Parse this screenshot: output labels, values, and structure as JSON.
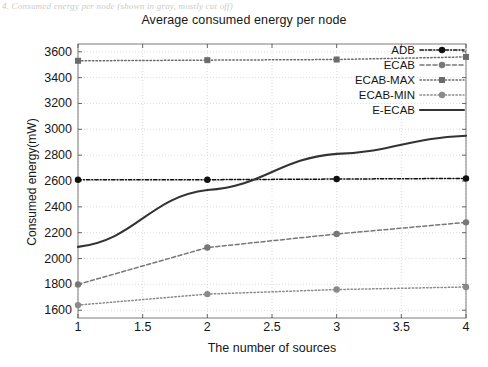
{
  "page": {
    "top_caption": "4. Consumed energy per node (shown in gray, mostly cut off)"
  },
  "chart_data": {
    "type": "line",
    "title": "Average consumed energy per node",
    "xlabel": "The number of sources",
    "ylabel": "Consumed energy(mW)",
    "x": [
      1,
      2,
      3,
      4
    ],
    "xlim": [
      1,
      4
    ],
    "ylim": [
      1540,
      3660
    ],
    "xticks": [
      "1",
      "1.5",
      "2",
      "2.5",
      "3",
      "3.5",
      "4"
    ],
    "xtick_values": [
      1,
      1.5,
      2,
      2.5,
      3,
      3.5,
      4
    ],
    "yticks": [
      "1600",
      "1800",
      "2000",
      "2200",
      "2400",
      "2600",
      "2800",
      "3000",
      "3200",
      "3400",
      "3600"
    ],
    "ytick_values": [
      1600,
      1800,
      2000,
      2200,
      2400,
      2600,
      2800,
      3000,
      3200,
      3400,
      3600
    ],
    "grid": true,
    "legend_position": "top-right",
    "series": [
      {
        "name": "ADB",
        "values": [
          2610,
          2610,
          2615,
          2620
        ],
        "style": "dash-dot",
        "marker": "circle",
        "color": "#111111"
      },
      {
        "name": "ECAB",
        "values": [
          1800,
          2085,
          2190,
          2280
        ],
        "style": "dashed",
        "marker": "circle",
        "color": "#777777"
      },
      {
        "name": "ECAB-MAX",
        "values": [
          3530,
          3535,
          3540,
          3560
        ],
        "style": "dotted",
        "marker": "square",
        "color": "#6b6b6b"
      },
      {
        "name": "ECAB-MIN",
        "values": [
          1640,
          1725,
          1760,
          1780
        ],
        "style": "dotted",
        "marker": "circle",
        "color": "#8a8a8a"
      },
      {
        "name": "E-ECAB",
        "values": [
          2090,
          2530,
          2810,
          2950
        ],
        "style": "solid",
        "marker": "none",
        "color": "#333333"
      }
    ]
  },
  "legend": {
    "items": [
      {
        "label": "ADB"
      },
      {
        "label": "ECAB"
      },
      {
        "label": "ECAB-MAX"
      },
      {
        "label": "ECAB-MIN"
      },
      {
        "label": "E-ECAB"
      }
    ]
  }
}
